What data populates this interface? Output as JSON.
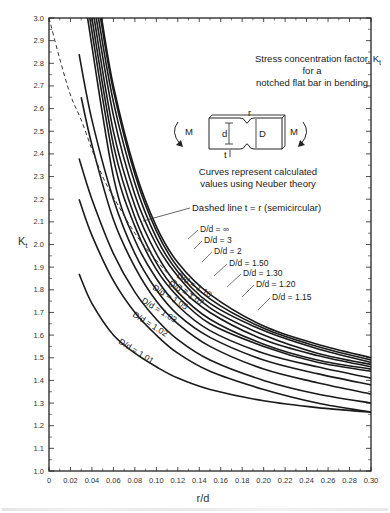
{
  "chart_data": {
    "type": "line",
    "title_lines": [
      "Stress concentration factor, K",
      "for a",
      "notched flat bar in bending"
    ],
    "title_subscript": "t",
    "xlabel": "r/d",
    "ylabel": "K",
    "ylabel_subscript": "t",
    "xlim": [
      0,
      0.3
    ],
    "ylim": [
      1.0,
      3.0
    ],
    "x_ticks": [
      "0",
      "0.02",
      "0.04",
      "0.06",
      "0.08",
      "0.10",
      "0.12",
      "0.14",
      "0.16",
      "0.18",
      "0.20",
      "0.22",
      "0.24",
      "0.26",
      "0.28",
      "0.30"
    ],
    "y_ticks": [
      "1.0",
      "1.1",
      "1.2",
      "1.3",
      "1.4",
      "1.5",
      "1.6",
      "1.7",
      "1.8",
      "1.9",
      "2.0",
      "2.1",
      "2.2",
      "2.3",
      "2.4",
      "2.5",
      "2.6",
      "2.7",
      "2.8",
      "2.9",
      "3.0"
    ],
    "grid": false,
    "annotations": [
      "Curves represent calculated",
      "values using Neuber theory",
      "Dashed line t = r (semicircular)"
    ],
    "diagram_labels": {
      "moment": "M",
      "notch_radius": "r",
      "net_width": "d",
      "full_width": "D",
      "notch_depth": "t"
    },
    "series": [
      {
        "name": "D/d = ∞",
        "points": [
          [
            0.049,
            3.0
          ],
          [
            0.06,
            2.7
          ],
          [
            0.08,
            2.33
          ],
          [
            0.1,
            2.08
          ],
          [
            0.12,
            1.92
          ],
          [
            0.15,
            1.78
          ],
          [
            0.2,
            1.64
          ],
          [
            0.25,
            1.56
          ],
          [
            0.3,
            1.5
          ]
        ]
      },
      {
        "name": "D/d = 3",
        "points": [
          [
            0.048,
            3.0
          ],
          [
            0.06,
            2.68
          ],
          [
            0.08,
            2.31
          ],
          [
            0.1,
            2.06
          ],
          [
            0.12,
            1.9
          ],
          [
            0.15,
            1.76
          ],
          [
            0.2,
            1.63
          ],
          [
            0.25,
            1.55
          ],
          [
            0.3,
            1.49
          ]
        ]
      },
      {
        "name": "D/d = 2",
        "points": [
          [
            0.046,
            3.0
          ],
          [
            0.06,
            2.63
          ],
          [
            0.08,
            2.27
          ],
          [
            0.1,
            2.03
          ],
          [
            0.12,
            1.88
          ],
          [
            0.15,
            1.74
          ],
          [
            0.2,
            1.62
          ],
          [
            0.25,
            1.54
          ],
          [
            0.3,
            1.48
          ]
        ]
      },
      {
        "name": "D/d = 1.50",
        "points": [
          [
            0.044,
            3.0
          ],
          [
            0.06,
            2.57
          ],
          [
            0.08,
            2.22
          ],
          [
            0.1,
            2.0
          ],
          [
            0.12,
            1.86
          ],
          [
            0.15,
            1.72
          ],
          [
            0.2,
            1.6
          ],
          [
            0.25,
            1.52
          ],
          [
            0.3,
            1.47
          ]
        ]
      },
      {
        "name": "D/d = 1.30",
        "points": [
          [
            0.042,
            3.0
          ],
          [
            0.06,
            2.5
          ],
          [
            0.08,
            2.17
          ],
          [
            0.1,
            1.96
          ],
          [
            0.12,
            1.82
          ],
          [
            0.15,
            1.7
          ],
          [
            0.2,
            1.58
          ],
          [
            0.25,
            1.51
          ],
          [
            0.3,
            1.46
          ]
        ]
      },
      {
        "name": "D/d = 1.20",
        "points": [
          [
            0.04,
            3.0
          ],
          [
            0.06,
            2.44
          ],
          [
            0.08,
            2.12
          ],
          [
            0.1,
            1.92
          ],
          [
            0.12,
            1.79
          ],
          [
            0.15,
            1.67
          ],
          [
            0.2,
            1.56
          ],
          [
            0.25,
            1.49
          ],
          [
            0.3,
            1.45
          ]
        ]
      },
      {
        "name": "D/d = 1.15",
        "points": [
          [
            0.038,
            3.0
          ],
          [
            0.06,
            2.38
          ],
          [
            0.08,
            2.08
          ],
          [
            0.1,
            1.89
          ],
          [
            0.12,
            1.77
          ],
          [
            0.15,
            1.65
          ],
          [
            0.2,
            1.55
          ],
          [
            0.25,
            1.48
          ],
          [
            0.3,
            1.44
          ]
        ]
      },
      {
        "name": "D/d = 1.10",
        "points": [
          [
            0.036,
            3.0
          ],
          [
            0.06,
            2.3
          ],
          [
            0.08,
            2.02
          ],
          [
            0.1,
            1.85
          ],
          [
            0.12,
            1.73
          ],
          [
            0.15,
            1.62
          ],
          [
            0.2,
            1.52
          ],
          [
            0.25,
            1.46
          ],
          [
            0.3,
            1.41
          ]
        ]
      },
      {
        "name": "D/d = 1.07",
        "points": [
          [
            0.028,
            2.84
          ],
          [
            0.04,
            2.55
          ],
          [
            0.06,
            2.2
          ],
          [
            0.08,
            1.96
          ],
          [
            0.1,
            1.8
          ],
          [
            0.12,
            1.69
          ],
          [
            0.15,
            1.59
          ],
          [
            0.2,
            1.49
          ],
          [
            0.25,
            1.43
          ],
          [
            0.3,
            1.38
          ]
        ]
      },
      {
        "name": "D/d = 1.05",
        "points": [
          [
            0.03,
            2.65
          ],
          [
            0.04,
            2.44
          ],
          [
            0.06,
            2.11
          ],
          [
            0.08,
            1.9
          ],
          [
            0.1,
            1.75
          ],
          [
            0.12,
            1.65
          ],
          [
            0.15,
            1.55
          ],
          [
            0.2,
            1.45
          ],
          [
            0.25,
            1.39
          ],
          [
            0.3,
            1.34
          ]
        ]
      },
      {
        "name": "D/d = 1.03",
        "points": [
          [
            0.028,
            2.38
          ],
          [
            0.04,
            2.2
          ],
          [
            0.06,
            1.96
          ],
          [
            0.08,
            1.79
          ],
          [
            0.1,
            1.67
          ],
          [
            0.12,
            1.58
          ],
          [
            0.15,
            1.49
          ],
          [
            0.2,
            1.4
          ],
          [
            0.25,
            1.34
          ],
          [
            0.3,
            1.3
          ]
        ]
      },
      {
        "name": "D/d = 1.02",
        "points": [
          [
            0.028,
            2.2
          ],
          [
            0.04,
            2.04
          ],
          [
            0.06,
            1.84
          ],
          [
            0.08,
            1.7
          ],
          [
            0.1,
            1.6
          ],
          [
            0.12,
            1.52
          ],
          [
            0.15,
            1.44
          ],
          [
            0.2,
            1.36
          ],
          [
            0.25,
            1.3
          ],
          [
            0.3,
            1.26
          ]
        ]
      },
      {
        "name": "D/d = 1.01",
        "points": [
          [
            0.028,
            1.87
          ],
          [
            0.04,
            1.74
          ],
          [
            0.06,
            1.6
          ],
          [
            0.08,
            1.52
          ],
          [
            0.1,
            1.46
          ],
          [
            0.12,
            1.41
          ],
          [
            0.15,
            1.36
          ],
          [
            0.2,
            1.31
          ],
          [
            0.25,
            1.28
          ],
          [
            0.3,
            1.26
          ]
        ]
      }
    ],
    "dashed_series": {
      "name": "t = r (semicircular)",
      "points": [
        [
          0.0,
          3.0
        ],
        [
          0.01,
          2.82
        ],
        [
          0.02,
          2.66
        ],
        [
          0.03,
          2.55
        ],
        [
          0.04,
          2.42
        ],
        [
          0.05,
          2.3
        ],
        [
          0.06,
          2.21
        ],
        [
          0.08,
          2.05
        ],
        [
          0.1,
          1.93
        ],
        [
          0.12,
          1.83
        ],
        [
          0.15,
          1.72
        ]
      ]
    }
  },
  "labels": {
    "title_l1": "Stress concentration factor, K",
    "title_sub": "t",
    "title_l2": "for a",
    "title_l3": "notched flat bar in bending",
    "note_l1": "Curves represent calculated",
    "note_l2": "values using Neuber theory",
    "dashed_note": "Dashed line t = r (semicircular)",
    "ylabel": "K",
    "ylabel_sub": "t",
    "xlabel": "r/d",
    "moment_left": "M",
    "moment_right": "M",
    "dim_d": "d",
    "dim_D": "D",
    "dim_r": "r",
    "dim_t": "t",
    "curve_labels": {
      "inf": "D/d = ∞",
      "d3": "D/d = 3",
      "d2": "D/d = 2",
      "d150": "D/d = 1.50",
      "d130": "D/d = 1.30",
      "d120": "D/d = 1.20",
      "d115": "D/d = 1.15",
      "d110": "D/d = 1.10",
      "d107": "D/d = 1.07",
      "d105": "D/d = 1.05",
      "d103": "D/d = 1.03",
      "d102": "D/d = 1.02",
      "d101": "D/d = 1.01"
    }
  }
}
